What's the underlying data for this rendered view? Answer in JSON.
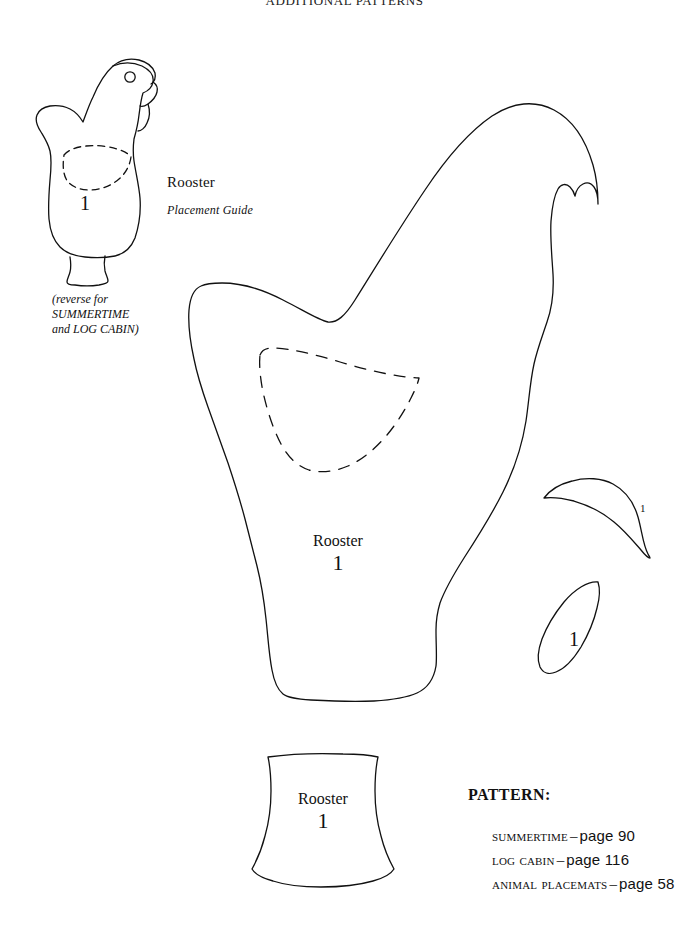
{
  "page": {
    "header_title": "ADDITIONAL PATTERNS",
    "background_color": "#ffffff",
    "ink_color": "#111111"
  },
  "placement_guide": {
    "title": "Rooster",
    "subtitle": "Placement Guide",
    "reverse_note": [
      "(reverse for",
      "SUMMERTIME",
      "and LOG CABIN)"
    ],
    "piece_number": "1"
  },
  "main_body": {
    "title": "Rooster",
    "piece_number": "1"
  },
  "base_piece": {
    "title": "Rooster",
    "piece_number": "1"
  },
  "wing_piece": {
    "piece_number": "1"
  },
  "beak_piece": {
    "piece_number": "1"
  },
  "pattern_section": {
    "heading": "PATTERN:",
    "entries": [
      {
        "name": "Summertime",
        "separator": "–",
        "page": "page 90"
      },
      {
        "name": "Log Cabin",
        "separator": "–",
        "page": "page 116"
      },
      {
        "name": "Animal Placemats",
        "separator": "–",
        "page": "page 58"
      }
    ]
  }
}
